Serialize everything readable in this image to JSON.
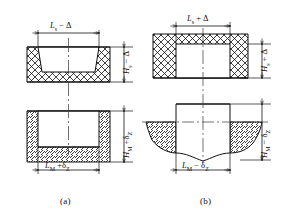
{
  "figure": {
    "type": "engineering-cross-section",
    "panels": [
      {
        "id": "a",
        "caption": "(a)",
        "description": "Cavity-forming dimensions: part shrinks, mold cavity made larger",
        "part": {
          "shape": "open-tray-cup",
          "hatch": "cross-hatch",
          "width_label": "Lₛ − Δ",
          "height_label": "Hₛ − Δ"
        },
        "mold": {
          "shape": "cavity-block",
          "hatch": "diagonal-hatch",
          "width_label": "Lₘ + δᴢ",
          "height_label": "Hₘ + δᴢ"
        },
        "labels": {
          "top": {
            "base": "L",
            "sub": "s",
            "op": "−",
            "tol": "Δ",
            "text": "Lₛ − Δ"
          },
          "top_right": {
            "base": "H",
            "sub": "s",
            "op": "−",
            "tol": "Δ",
            "text": "Hₛ − Δ"
          },
          "bottom": {
            "base": "L",
            "sub": "M",
            "op": "+",
            "tol": "δᴢ",
            "text": "Lₘ + δᴢ"
          },
          "bottom_right": {
            "base": "H",
            "sub": "M",
            "op": "+",
            "tol": "δᴢ",
            "text": "Hₘ + δᴢ"
          }
        }
      },
      {
        "id": "b",
        "caption": "(b)",
        "description": "Core-forming dimensions: part hole shrinks, mold core made smaller",
        "part": {
          "shape": "block-with-rectangular-hole",
          "hatch": "cross-hatch",
          "width_label": "Lₛ + Δ",
          "height_label": "Hₛ + Δ"
        },
        "mold": {
          "shape": "projecting-core",
          "hatch": "diagonal-hatch",
          "width_label": "Lₘ − δᴢ",
          "height_label": "Hₘ − δᴢ"
        },
        "labels": {
          "top": {
            "base": "L",
            "sub": "s",
            "op": "+",
            "tol": "Δ",
            "text": "Lₛ + Δ"
          },
          "top_right": {
            "base": "H",
            "sub": "s",
            "op": "+",
            "tol": "Δ",
            "text": "Hₛ + Δ"
          },
          "bottom": {
            "base": "L",
            "sub": "M",
            "op": "−",
            "tol": "δᴢ",
            "text": "Lₘ − δᴢ"
          },
          "bottom_right": {
            "base": "H",
            "sub": "M",
            "op": "−",
            "tol": "δᴢ",
            "text": "Hₘ − δᴢ"
          }
        }
      }
    ],
    "symbols": {
      "L": "length dimension",
      "H": "height dimension",
      "s": "part (shrunk) subscript",
      "M": "mold subscript",
      "delta": "Δ shrinkage allowance",
      "delta_z": "δᴢ manufacturing tolerance"
    },
    "colors": {
      "line": "#111111",
      "background": "#ffffff",
      "centerline": "#333333"
    }
  }
}
